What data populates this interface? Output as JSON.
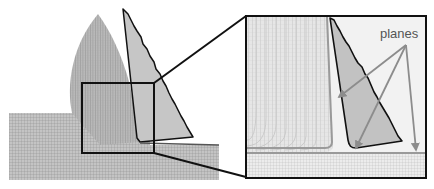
{
  "figure": {
    "annotation_label": "planes",
    "arrow_count": 3,
    "colors": {
      "mesh_fill": "#bdbdbd",
      "mesh_line": "#8a8a8a",
      "tool_fill": "#c8c8c8",
      "outline": "#111111",
      "plane_arrow": "#8c8c8c",
      "plane_line": "#9a9a9a",
      "background": "#ffffff"
    }
  }
}
